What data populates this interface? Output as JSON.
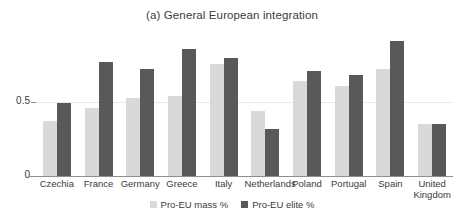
{
  "chart_data": {
    "type": "bar",
    "title": "(a) General European integration",
    "xlabel": "",
    "ylabel": "",
    "ylim": [
      0,
      1.0
    ],
    "yticks": [
      0,
      0.5
    ],
    "ytick_labels": [
      "0",
      "0.5"
    ],
    "grid": "horizontal-at-0.5",
    "legend_position": "bottom-center",
    "categories": [
      "Czechia",
      "France",
      "Germany",
      "Greece",
      "Italy",
      "Netherlands",
      "Poland",
      "Portugal",
      "Spain",
      "United Kingdom"
    ],
    "series": [
      {
        "name": "Pro-EU mass %",
        "color": "#d9d9d9",
        "values": [
          0.37,
          0.46,
          0.53,
          0.54,
          0.76,
          0.44,
          0.64,
          0.61,
          0.72,
          0.35
        ]
      },
      {
        "name": "Pro-EU elite %",
        "color": "#595959",
        "values": [
          0.49,
          0.77,
          0.72,
          0.86,
          0.8,
          0.32,
          0.71,
          0.68,
          0.91,
          0.35
        ]
      }
    ]
  },
  "legend": {
    "items": [
      {
        "label": "Pro-EU mass %",
        "color": "#d9d9d9"
      },
      {
        "label": "Pro-EU elite %",
        "color": "#595959"
      }
    ]
  },
  "axis": {
    "y_tick_0": "0",
    "y_tick_half": "0.5"
  }
}
